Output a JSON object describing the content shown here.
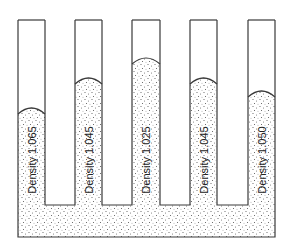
{
  "diagram": {
    "title": "",
    "colors": {
      "stroke": "#3a3a3a",
      "fill": "#ffffff",
      "stipple": "#555555"
    },
    "tubes": [
      {
        "label": "Density 1.065",
        "x": 18,
        "width": 27,
        "meniscus_y": 108
      },
      {
        "label": "Density 1.045",
        "x": 75,
        "width": 27,
        "meniscus_y": 78
      },
      {
        "label": "Density 1.025",
        "x": 132,
        "width": 28,
        "meniscus_y": 58
      },
      {
        "label": "Density 1.045",
        "x": 190,
        "width": 27,
        "meniscus_y": 78
      },
      {
        "label": "Density 1.050",
        "x": 248,
        "width": 27,
        "meniscus_y": 91
      }
    ],
    "tube_top_y": 20,
    "gap_bottom_y": 205,
    "base_bottom_y": 237
  }
}
